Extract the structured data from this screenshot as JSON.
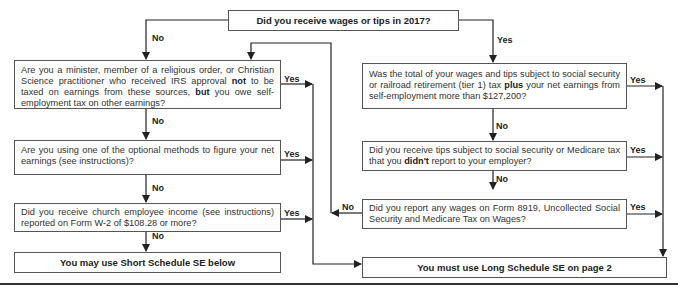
{
  "flowchart": {
    "start": {
      "text": "Did you receive wages or tips in 2017?"
    },
    "left_branch_label": "No",
    "right_branch_label": "Yes",
    "left_questions": [
      {
        "id": "minister",
        "parts": [
          "Are you a minister, member of a religious order, or Christian Science practitioner who received IRS approval ",
          "not",
          " to be taxed on earnings from these sources, ",
          "but",
          " you owe self-employment tax on other earnings?"
        ],
        "yes_label": "Yes",
        "no_label": "No"
      },
      {
        "id": "optional-methods",
        "parts": [
          "Are you using one of the optional methods to figure your net earnings (see instructions)?"
        ],
        "yes_label": "Yes",
        "no_label": "No"
      },
      {
        "id": "church-income",
        "parts": [
          "Did you receive church employee income (see instructions) reported on Form  W-2 of $108.28 or more?"
        ],
        "yes_label": "Yes",
        "no_label": "No"
      }
    ],
    "right_questions": [
      {
        "id": "wage-total",
        "parts": [
          "Was the total of your wages and tips subject to social security or railroad retirement (tier 1) tax ",
          "plus",
          " your net earnings from self-employment more than $127,200?"
        ],
        "yes_label": "Yes",
        "no_label": "No"
      },
      {
        "id": "unreported-tips",
        "parts": [
          "Did you receive tips subject to social security or Medicare tax that you ",
          "didn't",
          " report to your employer?"
        ],
        "yes_label": "Yes",
        "no_label": "No"
      },
      {
        "id": "form-8919",
        "parts": [
          "Did you report any wages on Form 8919, Uncollected Social Security and Medicare Tax on Wages?"
        ],
        "yes_label": "Yes",
        "no_label": "No"
      }
    ],
    "outcomes": {
      "short": "You may use Short Schedule SE below",
      "long": "You must use Long Schedule SE on page 2"
    }
  }
}
